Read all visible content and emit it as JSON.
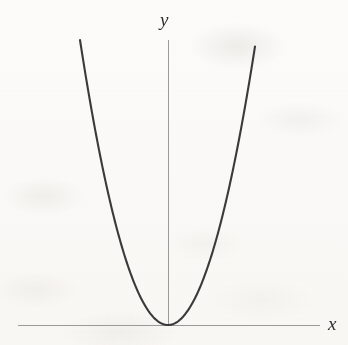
{
  "figure": {
    "name": "parabola-graph",
    "background_color": "#fcfbf9",
    "width": 348,
    "height": 345
  },
  "axes": {
    "x_axis": {
      "label": "x",
      "color": "#9a9a98",
      "stroke_width": 1,
      "x_start": 18,
      "x_end": 320,
      "y": 325
    },
    "y_axis": {
      "label": "y",
      "color": "#9a9a98",
      "stroke_width": 1,
      "x": 168,
      "y_start": 40,
      "y_end": 325
    }
  },
  "chart_data": {
    "type": "line",
    "title": "",
    "xlabel": "x",
    "ylabel": "y",
    "grid": false,
    "legend": null,
    "curve_color": "#3a3a3a",
    "curve_stroke_width": 2.1,
    "equation": "y = a x^2",
    "vertex": [
      0,
      0
    ],
    "opens": "up",
    "origin_px": [
      168,
      325
    ],
    "pixel_coefficient": 0.0368,
    "xlim": [
      -88,
      87
    ],
    "ylim": [
      0,
      283
    ],
    "x": [
      -88,
      -80,
      -70,
      -60,
      -50,
      -40,
      -30,
      -20,
      -10,
      0,
      10,
      20,
      30,
      40,
      50,
      60,
      70,
      80,
      87
    ],
    "values": [
      285,
      236,
      180,
      132,
      92,
      59,
      33,
      15,
      4,
      0,
      4,
      15,
      33,
      59,
      92,
      132,
      180,
      236,
      279
    ]
  }
}
